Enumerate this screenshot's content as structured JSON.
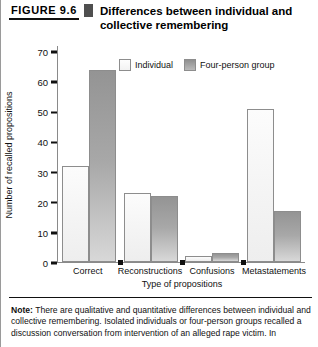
{
  "figure": {
    "number": "FIGURE 9.6",
    "title": "Differences between individual and collective remembering"
  },
  "legend": {
    "individual_label": "Individual",
    "group_label": "Four-person group"
  },
  "note": {
    "prefix": "Note:",
    "line1": " There are qualitative and quantitative differences between individual",
    "line2": "and collective remembering. Isolated individuals or four-person groups",
    "line3": "recalled a discussion conversation from intervention of an alleged rape victim. In"
  },
  "colors": {
    "individual_fill": "#f5f5f5",
    "group_fill": "#a0a0a0",
    "outline": "#8d8d8d",
    "axis": "#8a8a8a",
    "text": "#111111",
    "separator": "#4f4f4f"
  },
  "chart_data": {
    "type": "bar",
    "title": "Differences between individual and collective remembering",
    "xlabel": "Type of propositions",
    "ylabel": "Number of recalled propositions",
    "ylim": [
      0,
      72
    ],
    "yticks": [
      0,
      10,
      20,
      30,
      40,
      50,
      60,
      70
    ],
    "ytick_labels": [
      "0",
      "10",
      "20",
      "30",
      "40",
      "50",
      "60",
      "70"
    ],
    "grid": false,
    "legend_position": "top-center",
    "categories": [
      "Correct",
      "Reconstructions",
      "Confusions",
      "Metastatements"
    ],
    "series": [
      {
        "name": "Individual",
        "values": [
          32,
          23,
          2,
          51
        ]
      },
      {
        "name": "Four-person group",
        "values": [
          64,
          22,
          3,
          17
        ]
      }
    ]
  }
}
